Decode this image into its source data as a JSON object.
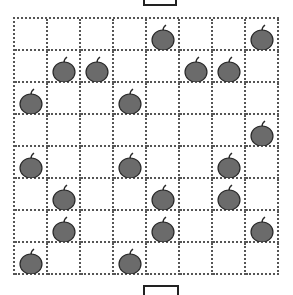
{
  "puzzle": {
    "rows": 8,
    "cols": 8,
    "apple_color": "#6b6b6b",
    "apple_outline": "#2a2a2a",
    "apples": [
      [
        0,
        0,
        0,
        0,
        1,
        0,
        0,
        1
      ],
      [
        0,
        1,
        1,
        0,
        0,
        1,
        1,
        0
      ],
      [
        1,
        0,
        0,
        1,
        0,
        0,
        0,
        0
      ],
      [
        0,
        0,
        0,
        0,
        0,
        0,
        0,
        1
      ],
      [
        1,
        0,
        0,
        1,
        0,
        0,
        1,
        0
      ],
      [
        0,
        1,
        0,
        0,
        1,
        0,
        1,
        0
      ],
      [
        0,
        1,
        0,
        0,
        1,
        0,
        0,
        1
      ],
      [
        1,
        0,
        0,
        1,
        0,
        0,
        0,
        0
      ]
    ]
  },
  "markers": {
    "top_box": "entry",
    "bottom_box": "exit"
  }
}
